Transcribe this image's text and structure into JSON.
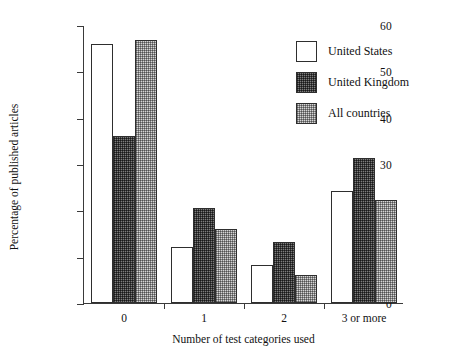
{
  "chart_data": {
    "type": "bar",
    "title": "",
    "xlabel": "Number of test categories used",
    "ylabel": "Percentage of published articles",
    "categories": [
      "0",
      "1",
      "2",
      "3 or more"
    ],
    "series": [
      {
        "name": "United States",
        "values": [
          55.8,
          12.0,
          8.2,
          24.1
        ],
        "style": "white-open"
      },
      {
        "name": "United Kingdom",
        "values": [
          36.0,
          20.5,
          13.1,
          31.3
        ],
        "style": "dark-hatch"
      },
      {
        "name": "All countries",
        "values": [
          56.8,
          16.0,
          6.1,
          22.2
        ],
        "style": "light-dot"
      }
    ],
    "ylim": [
      0,
      60
    ],
    "yticks": [
      0,
      10,
      20,
      30,
      40,
      50,
      60
    ],
    "ytick_labels": [
      "0",
      "10",
      "20",
      "30",
      "40",
      "50",
      "60"
    ],
    "grid": false,
    "legend_position": "top-right"
  },
  "legend": {
    "items": [
      {
        "label": "United States"
      },
      {
        "label": "United Kingdom"
      },
      {
        "label": "All countries"
      }
    ]
  },
  "colors": {
    "axis": "#3a3a3a",
    "bar_outline": "#2e2e2e",
    "united_states": "#ffffff",
    "united_kingdom": "#7d7d7d",
    "all_countries": "#d6d6d6",
    "background": "#ffffff",
    "text": "#111111"
  }
}
